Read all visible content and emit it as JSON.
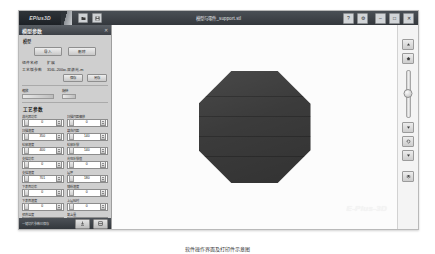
{
  "window": {
    "logo": "EPlus3D",
    "title": "模型与零件_support.stl",
    "controls": {
      "help": "?",
      "settings": "⚙",
      "minimize": "–",
      "maximize": "□",
      "close": "✕"
    },
    "toolbar_icons": [
      "open-file-icon",
      "save-file-icon"
    ]
  },
  "panel": {
    "header": {
      "title": "模型参数",
      "close": "✕"
    },
    "model_group": {
      "label": "模型",
      "buttons": [
        "导入",
        "删除"
      ],
      "rows": [
        {
          "key": "组件名称",
          "value": "扩展"
        },
        {
          "key": "工艺版参数",
          "value": "316L-200w-双激光-m"
        }
      ],
      "action_buttons": [
        "保存",
        "另存"
      ]
    },
    "sliders": [
      {
        "label": "缩放",
        "value": "100%"
      },
      {
        "label": "旋转",
        "value": "0"
      }
    ],
    "process_group": {
      "title": "工艺参数",
      "fields": [
        {
          "label": "激光器功率",
          "value": "0"
        },
        {
          "label": "扫描间距偏移",
          "value": "0"
        },
        {
          "label": "扫描速度",
          "value": "350"
        },
        {
          "label": "填充间距",
          "value": "140"
        },
        {
          "label": "轮廓速度",
          "value": "400"
        },
        {
          "label": "轮廓补偿",
          "value": "140"
        },
        {
          "label": "支撑功率",
          "value": "0"
        },
        {
          "label": "光斑补偿值",
          "value": "0"
        },
        {
          "label": "支撑速度",
          "value": "701"
        },
        {
          "label": "层厚",
          "value": "180"
        },
        {
          "label": "下表面功率",
          "value": "0"
        },
        {
          "label": "铺粉速度",
          "value": "0"
        },
        {
          "label": "下表面速度",
          "value": "0"
        },
        {
          "label": "上层延时",
          "value": "0"
        },
        {
          "label": "预热温度",
          "value": "0"
        },
        {
          "label": "氧含量",
          "value": "0"
        },
        {
          "label": "基板温度",
          "value": "0"
        },
        {
          "label": "保护气流量",
          "value": "0"
        }
      ]
    },
    "footer": {
      "note": "一键切片参数已保存",
      "buttons": [
        "export-icon",
        "slice-icon"
      ]
    }
  },
  "viewport": {
    "part_name": "octagonal-prism-model",
    "watermark": "E-Plus-3D"
  },
  "rail": {
    "buttons": [
      {
        "name": "view-up-icon",
        "glyph": "▲"
      },
      {
        "name": "view-home-icon",
        "glyph": "⌂"
      },
      {
        "name": "view-fit-icon",
        "glyph": "⤡"
      },
      {
        "name": "view-rotate-icon",
        "glyph": "↻"
      },
      {
        "name": "view-down-icon",
        "glyph": "▼"
      },
      {
        "name": "view-layer-icon",
        "glyph": "▦"
      }
    ],
    "zoom_slider": {
      "name": "zoom-slider",
      "value": "50"
    }
  },
  "caption": "软件操作界面及打印件示意图"
}
